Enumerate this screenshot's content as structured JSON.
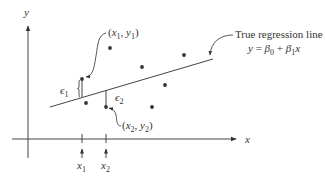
{
  "diagram": {
    "axes": {
      "x_label": "x",
      "y_label": "y"
    },
    "regression_line": {
      "title": "True regression line",
      "equation": "y = β0 + β1x",
      "equation_parts": {
        "y": "y",
        "eq": " = ",
        "b": "β",
        "sub0": "0",
        "plus": " + ",
        "sub1": "1",
        "x": "x"
      }
    },
    "annotations": {
      "point1": "(x1, y1)",
      "point1_parts": {
        "open": "(",
        "x": "x",
        "s1": "1",
        "comma": ", ",
        "y": "y",
        "s2": "1",
        "close": ")"
      },
      "point2": "(x2, y2)",
      "point2_parts": {
        "open": "(",
        "x": "x",
        "s1": "2",
        "comma": ", ",
        "y": "y",
        "s2": "2",
        "close": ")"
      },
      "error1": "ε1",
      "error1_parts": {
        "eps": "ϵ",
        "sub": "1"
      },
      "error2": "ε2",
      "error2_parts": {
        "eps": "ϵ",
        "sub": "2"
      }
    },
    "x_ticks": [
      {
        "label": "x",
        "sub": "1"
      },
      {
        "label": "x",
        "sub": "2"
      }
    ],
    "points": [
      {
        "name": "x1-y1",
        "cx": 82,
        "cy": 79
      },
      {
        "name": "x2-y2",
        "cx": 106,
        "cy": 107
      },
      {
        "name": "point-a",
        "cx": 110,
        "cy": 48
      },
      {
        "name": "point-b",
        "cx": 86,
        "cy": 103
      },
      {
        "name": "point-c",
        "cx": 142,
        "cy": 67
      },
      {
        "name": "point-d",
        "cx": 184,
        "cy": 55
      },
      {
        "name": "point-e",
        "cx": 165,
        "cy": 85
      },
      {
        "name": "point-f",
        "cx": 152,
        "cy": 107
      }
    ],
    "colors": {
      "ink": "#333333",
      "background": "#ffffff"
    }
  }
}
